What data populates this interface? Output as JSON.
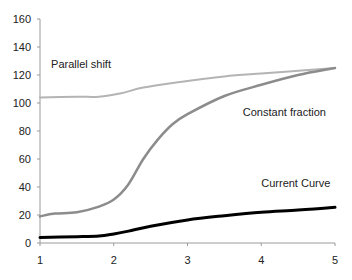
{
  "chart_data": {
    "type": "line",
    "title": "",
    "xlabel": "",
    "ylabel": "",
    "xlim": [
      1,
      5
    ],
    "ylim": [
      0,
      160
    ],
    "x_ticks": [
      "1",
      "2",
      "3",
      "4",
      "5"
    ],
    "y_ticks": [
      "0",
      "20",
      "40",
      "60",
      "80",
      "100",
      "120",
      "140",
      "160"
    ],
    "grid": false,
    "legend": "inline labels",
    "series": [
      {
        "name": "Parallel shift",
        "color": "#b4b4b4",
        "x": [
          1,
          1.5,
          1.8,
          2.1,
          2.4,
          2.9,
          3.5,
          4,
          4.5,
          5
        ],
        "values": [
          104,
          104.5,
          104.5,
          107,
          111,
          115,
          119,
          121,
          123,
          125
        ]
      },
      {
        "name": "Constant fraction",
        "color": "#8c8c8c",
        "x": [
          1,
          1.2,
          1.5,
          1.8,
          2.0,
          2.2,
          2.4,
          2.6,
          2.8,
          3.0,
          3.5,
          4.0,
          4.5,
          5.0
        ],
        "values": [
          19,
          21,
          22,
          26,
          31,
          42,
          60,
          74,
          85,
          92,
          105,
          113,
          120,
          125
        ]
      },
      {
        "name": "Current Curve",
        "color": "#000000",
        "x": [
          1,
          1.5,
          1.8,
          2.0,
          2.2,
          2.5,
          3.0,
          3.5,
          4.0,
          4.5,
          5.0
        ],
        "values": [
          4,
          4.5,
          5,
          6.5,
          8.5,
          12,
          16.5,
          19.5,
          22,
          23.5,
          25.5
        ]
      }
    ],
    "annotations": [
      {
        "text": "Parallel shift",
        "x": 1.15,
        "y": 125
      },
      {
        "text": "Constant fraction",
        "x": 3.75,
        "y": 91
      },
      {
        "text": "Current Curve",
        "x": 4.0,
        "y": 40
      }
    ]
  }
}
